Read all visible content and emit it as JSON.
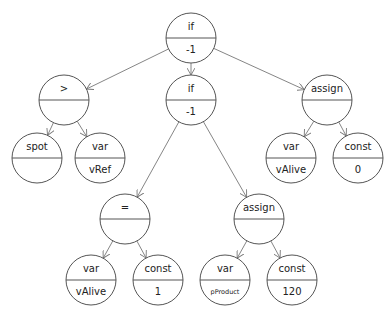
{
  "diagram": {
    "type": "expression-tree",
    "nodes": [
      {
        "id": "n0",
        "top": "if",
        "bottom": "-1",
        "x": 191,
        "y": 38
      },
      {
        "id": "n1",
        "top": ">",
        "bottom": "",
        "x": 64,
        "y": 100
      },
      {
        "id": "n2",
        "top": "if",
        "bottom": "-1",
        "x": 191,
        "y": 100
      },
      {
        "id": "n3",
        "top": "assign",
        "bottom": "",
        "x": 327,
        "y": 100
      },
      {
        "id": "n4",
        "top": "spot",
        "bottom": "",
        "x": 37,
        "y": 158
      },
      {
        "id": "n5",
        "top": "var",
        "bottom": "vRef",
        "x": 100,
        "y": 158
      },
      {
        "id": "n6",
        "top": "var",
        "bottom": "vAlive",
        "x": 291,
        "y": 158
      },
      {
        "id": "n7",
        "top": "const",
        "bottom": "0",
        "x": 358,
        "y": 158
      },
      {
        "id": "n8",
        "top": "=",
        "bottom": "",
        "x": 125,
        "y": 219
      },
      {
        "id": "n9",
        "top": "assign",
        "bottom": "",
        "x": 259,
        "y": 219
      },
      {
        "id": "n10",
        "top": "var",
        "bottom": "vAlive",
        "x": 91,
        "y": 280
      },
      {
        "id": "n11",
        "top": "const",
        "bottom": "1",
        "x": 158,
        "y": 280
      },
      {
        "id": "n12",
        "top": "var",
        "bottom": "pProduct",
        "x": 225,
        "y": 280
      },
      {
        "id": "n13",
        "top": "const",
        "bottom": "120",
        "x": 292,
        "y": 280
      }
    ],
    "edges": [
      [
        "n0",
        "n1"
      ],
      [
        "n0",
        "n2"
      ],
      [
        "n0",
        "n3"
      ],
      [
        "n1",
        "n4"
      ],
      [
        "n1",
        "n5"
      ],
      [
        "n3",
        "n6"
      ],
      [
        "n3",
        "n7"
      ],
      [
        "n2",
        "n8"
      ],
      [
        "n2",
        "n9"
      ],
      [
        "n8",
        "n10"
      ],
      [
        "n8",
        "n11"
      ],
      [
        "n9",
        "n12"
      ],
      [
        "n9",
        "n13"
      ]
    ],
    "colors": {
      "stroke": "#555555",
      "edge": "#777777",
      "text": "#222222",
      "background": "#ffffff"
    }
  }
}
